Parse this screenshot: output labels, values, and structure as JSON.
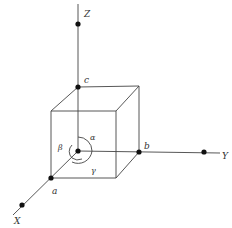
{
  "diagram": {
    "type": "unit-cell-axes",
    "axes": [
      {
        "name": "x-axis",
        "label": "X",
        "from": [
          78,
          151
        ],
        "to": [
          13,
          215
        ],
        "point": [
          22,
          205
        ],
        "label_pos": [
          14,
          223
        ]
      },
      {
        "name": "y-axis",
        "label": "Y",
        "from": [
          78,
          151
        ],
        "to": [
          220,
          153
        ],
        "point": [
          204,
          152
        ],
        "label_pos": [
          223,
          158
        ]
      },
      {
        "name": "z-axis",
        "label": "Z",
        "from": [
          78,
          151
        ],
        "to": [
          78,
          4
        ],
        "point": [
          78,
          24
        ],
        "label_pos": [
          84,
          17
        ]
      }
    ],
    "edge_points": [
      {
        "name": "a",
        "label": "a",
        "pos": [
          51,
          178
        ],
        "label_pos": [
          52,
          193
        ]
      },
      {
        "name": "b",
        "label": "b",
        "pos": [
          139,
          152
        ],
        "label_pos": [
          144,
          147
        ]
      },
      {
        "name": "c",
        "label": "c",
        "pos": [
          78,
          87
        ],
        "label_pos": [
          84,
          83
        ]
      }
    ],
    "origin": [
      78,
      151
    ],
    "angles": [
      {
        "name": "alpha",
        "label": "α",
        "label_pos": [
          90,
          139
        ]
      },
      {
        "name": "beta",
        "label": "β",
        "label_pos": [
          58,
          149
        ]
      },
      {
        "name": "gamma",
        "label": "γ",
        "label_pos": [
          91,
          172
        ]
      }
    ],
    "cube": {
      "front": [
        [
          51,
          111
        ],
        [
          116,
          111
        ],
        [
          116,
          178
        ],
        [
          51,
          178
        ]
      ],
      "back": [
        [
          78,
          87
        ],
        [
          139,
          86
        ],
        [
          139,
          152
        ],
        [
          78,
          151
        ]
      ]
    }
  }
}
